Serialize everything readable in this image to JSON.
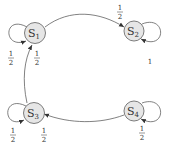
{
  "diagram": {
    "type": "markov-chain",
    "nodes": [
      {
        "id": "S1",
        "base": "S",
        "sub": "1"
      },
      {
        "id": "S2",
        "base": "S",
        "sub": "2"
      },
      {
        "id": "S3",
        "base": "S",
        "sub": "3"
      },
      {
        "id": "S4",
        "base": "S",
        "sub": "4"
      }
    ],
    "edges": [
      {
        "from": "S1",
        "to": "S2",
        "num": "1",
        "den": "2"
      },
      {
        "from": "S1",
        "to": "S1",
        "num": "1",
        "den": "2"
      },
      {
        "from": "S2",
        "to": "S2",
        "label": "1"
      },
      {
        "from": "S3",
        "to": "S1",
        "num": "1",
        "den": "2"
      },
      {
        "from": "S3",
        "to": "S3",
        "num": "1",
        "den": "2"
      },
      {
        "from": "S4",
        "to": "S3",
        "num": "1",
        "den": "2"
      },
      {
        "from": "S4",
        "to": "S4",
        "num": "1",
        "den": "2"
      }
    ]
  }
}
